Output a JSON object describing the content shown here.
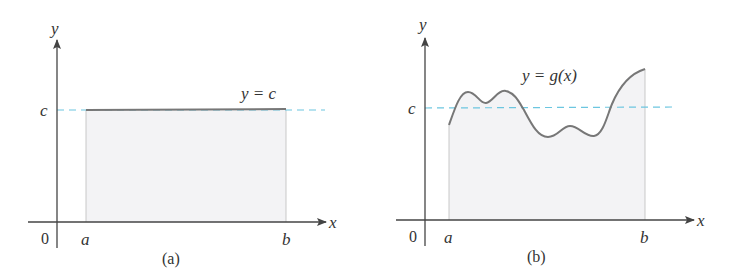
{
  "figure": {
    "panels": [
      {
        "id": "a",
        "caption": "(a)",
        "y_axis_label": "y",
        "x_axis_label": "x",
        "origin_label": "0",
        "a_label": "a",
        "b_label": "b",
        "c_label": "c",
        "curve_label": "y = c",
        "curve_type": "constant"
      },
      {
        "id": "b",
        "caption": "(b)",
        "y_axis_label": "y",
        "x_axis_label": "x",
        "origin_label": "0",
        "a_label": "a",
        "b_label": "b",
        "c_label": "c",
        "curve_label": "y = g(x)",
        "curve_type": "wavy"
      }
    ],
    "colors": {
      "axis": "#444444",
      "curve": "#777777",
      "fill": "#f3f3f5",
      "dashed_line": "#6cc6e0",
      "text": "#333333"
    }
  }
}
